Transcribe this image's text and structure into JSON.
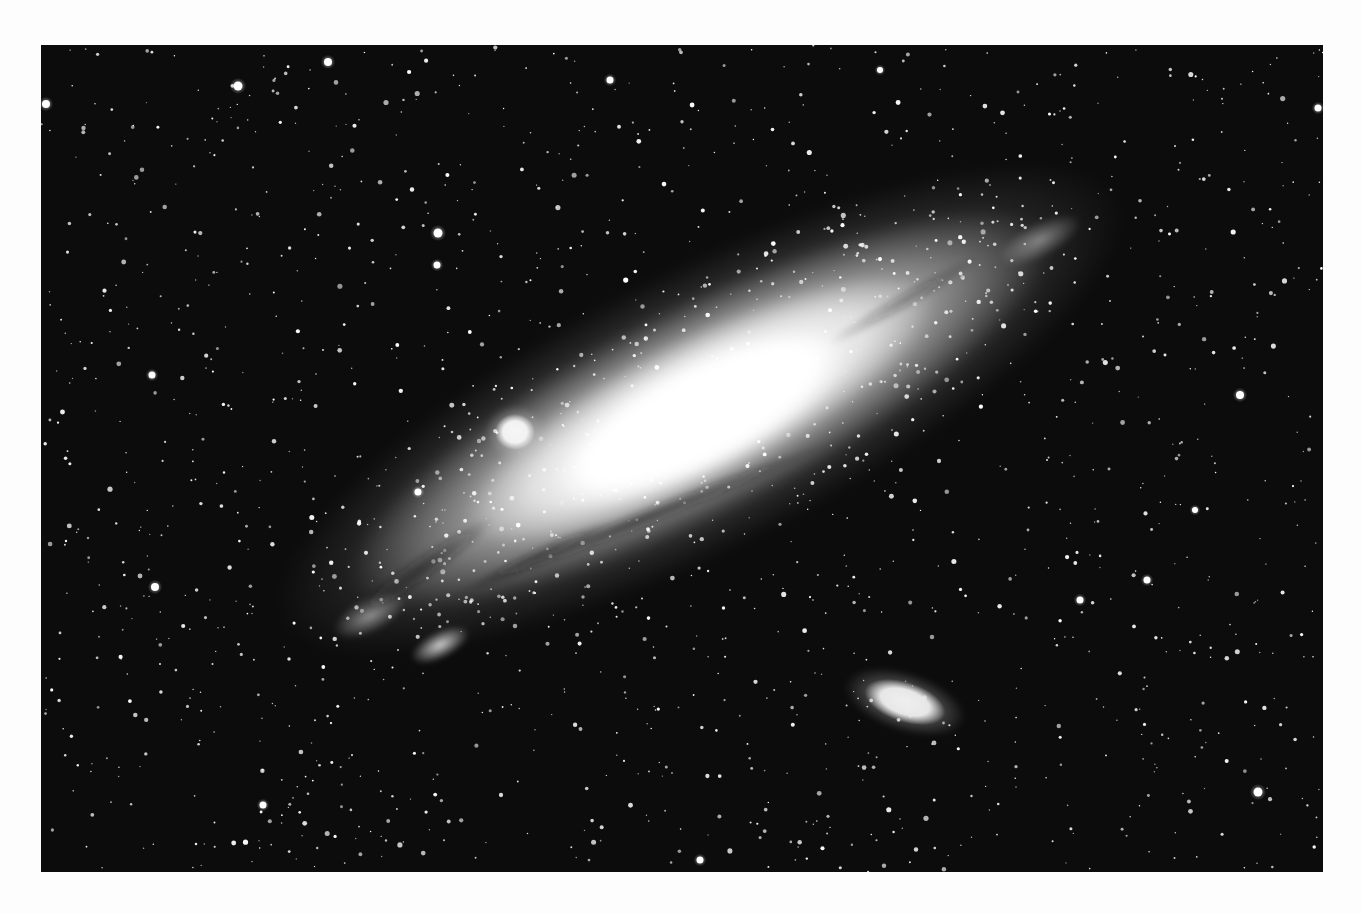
{
  "page": {
    "background": "#fdfdfd",
    "width": 1361,
    "height": 913
  },
  "photo": {
    "description": "Black and white photograph of the Andromeda Galaxy (M31) with satellite galaxies M32 and M110",
    "x": 41,
    "y": 45,
    "width": 1282,
    "height": 827,
    "sky_color": "#0c0c0c",
    "galaxy": {
      "name": "M31",
      "center": [
        700,
        410
      ],
      "angle_deg": -27,
      "outer_halo": {
        "rx": 470,
        "ry": 140,
        "color": "#b9b9b9",
        "opacity": 0.55
      },
      "disk": {
        "rx": 390,
        "ry": 105,
        "color": "#dcdcdc",
        "opacity": 0.85
      },
      "inner_disk": {
        "rx": 260,
        "ry": 72,
        "color": "#f2f2f2",
        "opacity": 0.95
      },
      "core": {
        "center": [
          700,
          415
        ],
        "rx": 170,
        "ry": 55,
        "color": "#ffffff"
      },
      "dust_lanes": [
        {
          "cx": 640,
          "cy": 520,
          "rx": 210,
          "ry": 10,
          "angle_deg": -22,
          "opacity": 0.55
        },
        {
          "cx": 420,
          "cy": 570,
          "rx": 90,
          "ry": 14,
          "angle_deg": -35,
          "opacity": 0.55
        },
        {
          "cx": 905,
          "cy": 300,
          "rx": 90,
          "ry": 10,
          "angle_deg": -30,
          "opacity": 0.35
        },
        {
          "cx": 540,
          "cy": 555,
          "rx": 80,
          "ry": 9,
          "angle_deg": -25,
          "opacity": 0.45
        }
      ],
      "arm_knots": [
        {
          "cx": 440,
          "cy": 645,
          "rx": 32,
          "ry": 14,
          "opacity": 0.85
        },
        {
          "cx": 370,
          "cy": 615,
          "rx": 40,
          "ry": 18,
          "opacity": 0.55
        },
        {
          "cx": 1040,
          "cy": 240,
          "rx": 45,
          "ry": 18,
          "opacity": 0.45
        }
      ]
    },
    "companions": [
      {
        "name": "M32",
        "cx": 515,
        "cy": 432,
        "rx": 20,
        "ry": 18,
        "angle_deg": 0,
        "color": "#f6f6f6"
      },
      {
        "name": "M110",
        "cx": 905,
        "cy": 702,
        "rx": 42,
        "ry": 20,
        "angle_deg": 18,
        "color": "#eeeeee"
      }
    ],
    "bright_stars": [
      {
        "cx": 438,
        "cy": 233,
        "r": 4.5
      },
      {
        "cx": 437,
        "cy": 265,
        "r": 3.5
      },
      {
        "cx": 238,
        "cy": 86,
        "r": 4.5
      },
      {
        "cx": 328,
        "cy": 62,
        "r": 4
      },
      {
        "cx": 46,
        "cy": 104,
        "r": 4
      },
      {
        "cx": 155,
        "cy": 587,
        "r": 4
      },
      {
        "cx": 418,
        "cy": 492,
        "r": 3.5
      },
      {
        "cx": 1240,
        "cy": 395,
        "r": 4
      },
      {
        "cx": 1258,
        "cy": 792,
        "r": 4.5
      },
      {
        "cx": 1147,
        "cy": 580,
        "r": 3.5
      },
      {
        "cx": 1318,
        "cy": 108,
        "r": 3.5
      },
      {
        "cx": 152,
        "cy": 375,
        "r": 3.5
      },
      {
        "cx": 1080,
        "cy": 600,
        "r": 3.5
      },
      {
        "cx": 263,
        "cy": 805,
        "r": 3.5
      },
      {
        "cx": 1195,
        "cy": 510,
        "r": 3
      },
      {
        "cx": 700,
        "cy": 860,
        "r": 3.5
      },
      {
        "cx": 610,
        "cy": 80,
        "r": 3.5
      },
      {
        "cx": 880,
        "cy": 70,
        "r": 3
      }
    ],
    "star_field": {
      "seed": 31,
      "count": 1500,
      "min_r": 0.7,
      "max_r": 2.6,
      "color": "#ffffff"
    }
  }
}
